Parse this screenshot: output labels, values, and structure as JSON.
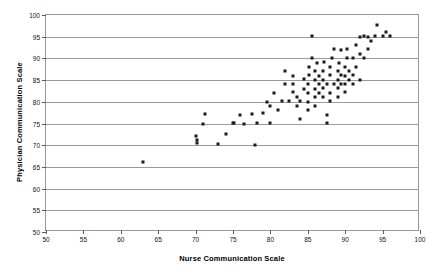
{
  "chart_data": {
    "type": "scatter",
    "title": "",
    "xlabel": "Nurse Communication Scale",
    "ylabel": "Physician Communication Scale",
    "xlim": [
      50,
      100
    ],
    "ylim": [
      50,
      100
    ],
    "xticks": [
      50,
      55,
      60,
      65,
      70,
      75,
      80,
      85,
      90,
      95,
      100
    ],
    "yticks": [
      50,
      55,
      60,
      65,
      70,
      75,
      80,
      85,
      90,
      95,
      100
    ],
    "xtick_labels": [
      "50",
      "55",
      "60",
      "65",
      "70",
      "75",
      "80",
      "85",
      "90",
      "95",
      "100"
    ],
    "ytick_labels": [
      "50",
      "55",
      "60",
      "65",
      "70",
      "75",
      "80",
      "85",
      "90",
      "95",
      "100"
    ],
    "grid": "horizontal",
    "legend": "none",
    "marker": "square",
    "marker_color": "#1a1a1a",
    "series": [
      {
        "name": "Hospitals",
        "points": [
          [
            63.0,
            66.2
          ],
          [
            70.0,
            72.2
          ],
          [
            70.2,
            71.1
          ],
          [
            70.2,
            70.4
          ],
          [
            71.0,
            74.8
          ],
          [
            71.2,
            77.3
          ],
          [
            73.0,
            70.2
          ],
          [
            74.0,
            72.6
          ],
          [
            75.0,
            75.1
          ],
          [
            75.2,
            75.2
          ],
          [
            76.0,
            77.0
          ],
          [
            76.5,
            75.0
          ],
          [
            77.5,
            77.2
          ],
          [
            78.0,
            70.1
          ],
          [
            78.2,
            75.2
          ],
          [
            79.0,
            77.4
          ],
          [
            79.5,
            80.0
          ],
          [
            80.0,
            75.2
          ],
          [
            80.0,
            79.0
          ],
          [
            80.5,
            82.1
          ],
          [
            81.0,
            78.0
          ],
          [
            81.5,
            80.2
          ],
          [
            82.0,
            84.1
          ],
          [
            82.0,
            87.1
          ],
          [
            82.5,
            80.1
          ],
          [
            83.0,
            82.2
          ],
          [
            83.0,
            84.2
          ],
          [
            83.0,
            86.0
          ],
          [
            83.5,
            79.0
          ],
          [
            83.5,
            81.0
          ],
          [
            84.0,
            76.1
          ],
          [
            84.0,
            80.1
          ],
          [
            84.5,
            83.0
          ],
          [
            84.5,
            85.2
          ],
          [
            85.0,
            78.2
          ],
          [
            85.0,
            80.0
          ],
          [
            85.0,
            82.0
          ],
          [
            85.0,
            84.0
          ],
          [
            85.2,
            86.1
          ],
          [
            85.2,
            88.0
          ],
          [
            85.5,
            90.2
          ],
          [
            85.5,
            95.1
          ],
          [
            86.0,
            79.0
          ],
          [
            86.0,
            81.0
          ],
          [
            86.0,
            83.0
          ],
          [
            86.0,
            85.0
          ],
          [
            86.0,
            87.1
          ],
          [
            86.2,
            89.0
          ],
          [
            86.5,
            82.0
          ],
          [
            86.5,
            84.1
          ],
          [
            86.5,
            86.0
          ],
          [
            87.0,
            81.0
          ],
          [
            87.0,
            83.2
          ],
          [
            87.0,
            85.0
          ],
          [
            87.0,
            87.0
          ],
          [
            87.2,
            89.1
          ],
          [
            87.5,
            75.2
          ],
          [
            87.5,
            77.0
          ],
          [
            87.5,
            84.0
          ],
          [
            88.0,
            80.1
          ],
          [
            88.0,
            82.0
          ],
          [
            88.0,
            86.2
          ],
          [
            88.0,
            88.0
          ],
          [
            88.2,
            90.1
          ],
          [
            88.5,
            84.0
          ],
          [
            88.5,
            92.2
          ],
          [
            89.0,
            81.0
          ],
          [
            89.0,
            83.1
          ],
          [
            89.0,
            85.0
          ],
          [
            89.0,
            87.2
          ],
          [
            89.2,
            89.0
          ],
          [
            89.5,
            84.0
          ],
          [
            89.5,
            86.1
          ],
          [
            89.5,
            92.0
          ],
          [
            90.0,
            82.2
          ],
          [
            90.0,
            84.2
          ],
          [
            90.0,
            86.0
          ],
          [
            90.0,
            88.0
          ],
          [
            90.2,
            90.0
          ],
          [
            90.2,
            92.1
          ],
          [
            90.5,
            85.0
          ],
          [
            90.5,
            87.1
          ],
          [
            91.0,
            84.0
          ],
          [
            91.0,
            86.2
          ],
          [
            91.0,
            90.0
          ],
          [
            91.5,
            88.1
          ],
          [
            91.5,
            93.0
          ],
          [
            92.0,
            85.1
          ],
          [
            92.0,
            91.0
          ],
          [
            92.0,
            95.0
          ],
          [
            92.5,
            90.0
          ],
          [
            92.5,
            95.1
          ],
          [
            93.0,
            92.1
          ],
          [
            93.0,
            95.0
          ],
          [
            93.5,
            94.0
          ],
          [
            94.0,
            95.1
          ],
          [
            94.2,
            97.8
          ],
          [
            95.0,
            95.2
          ],
          [
            95.5,
            96.1
          ],
          [
            96.0,
            95.1
          ]
        ]
      }
    ]
  },
  "axes": {
    "plot_left_px": 45,
    "plot_top_px": 14,
    "plot_width_px": 374,
    "plot_height_px": 217
  }
}
